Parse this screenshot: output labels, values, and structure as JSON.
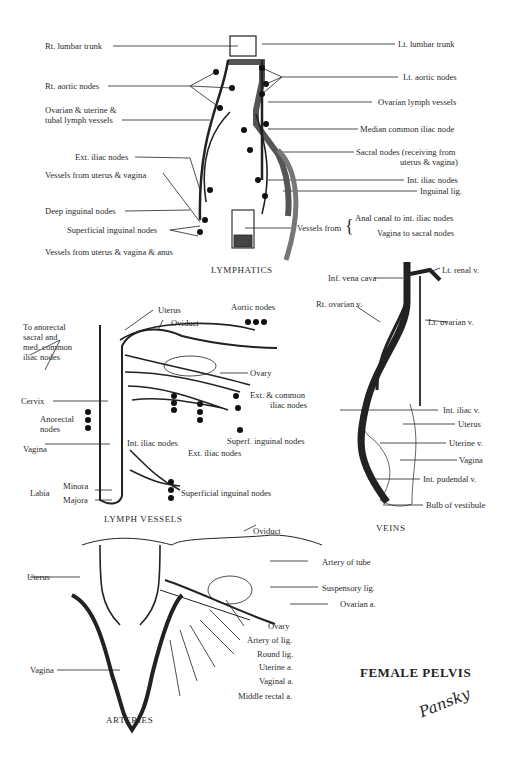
{
  "plate_title": "FEMALE PELVIS",
  "signature": "Pansky",
  "panels": {
    "lymphatics": {
      "title": "LYMPHATICS",
      "labels_left": [
        "Rt. lumbar trunk",
        "Rt. aortic nodes",
        "Ovarian & uterine &",
        "tubal lymph vessels",
        "Ext. iliac nodes",
        "Vessels from uterus & vagina",
        "Deep inguinal nodes",
        "Superficial inguinal nodes",
        "Vessels from uterus & vagina & anus"
      ],
      "labels_right": [
        "Lt. lumbar trunk",
        "Lt. aortic nodes",
        "Ovarian lymph vessels",
        "Median common iliac node",
        "Sacral nodes (receiving from",
        "uterus & vagina)",
        "Int. iliac nodes",
        "Inguinal lig.",
        "Vessels from",
        "Anal canal to int. iliac nodes",
        "Vagina to sacral nodes"
      ]
    },
    "lymph_vessels": {
      "title": "LYMPH VESSELS",
      "labels": {
        "uterus": "Uterus",
        "oviduct": "Oviduct",
        "aortic_nodes": "Aortic nodes",
        "to_anorectal_1": "To anorectal",
        "to_anorectal_2": "sacral and",
        "to_anorectal_3": "med. common",
        "to_anorectal_4": "iliac nodes",
        "ovary": "Ovary",
        "cervix": "Cervix",
        "ext_common_1": "Ext. & common",
        "ext_common_2": "iliac nodes",
        "anorectal_1": "Anorectal",
        "anorectal_2": "nodes",
        "vagina": "Vagina",
        "int_iliac": "Int. iliac nodes",
        "superf_inguinal": "Superf. inguinal nodes",
        "ext_iliac": "Ext. iliac nodes",
        "labia": "Labia",
        "minora": "Minora",
        "majora": "Majora",
        "superficial_inguinal": "Superficial inguinal nodes"
      }
    },
    "veins": {
      "title": "VEINS",
      "labels": {
        "inf_vena_cava": "Inf. vena cava",
        "lt_renal": "Lt. renal v.",
        "rt_ovarian": "Rt. ovarian v.",
        "lt_ovarian": "Lt. ovarian v.",
        "int_iliac": "Int. iliac v.",
        "uterus": "Uterus",
        "uterine": "Uterine v.",
        "vagina": "Vagina",
        "int_pudendal": "Int. pudendal v.",
        "bulb": "Bulb of vestibule"
      }
    },
    "arteries": {
      "title": "ARTERIES",
      "labels": {
        "oviduct": "Oviduct",
        "uterus": "Uterus",
        "artery_of_tube": "Artery of tube",
        "suspensory": "Suspensory lig.",
        "ovarian_a": "Ovarian a.",
        "ovary": "Ovary",
        "artery_of_lig": "Artery of lig.",
        "round_lig": "Round lig.",
        "uterine_a": "Uterine a.",
        "vagina": "Vagina",
        "vaginal_a": "Vaginal a.",
        "middle_rectal": "Middle rectal a."
      }
    }
  }
}
